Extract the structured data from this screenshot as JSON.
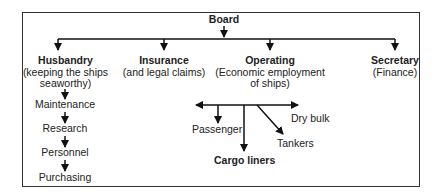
{
  "diagram": {
    "root": "Board",
    "departments": [
      {
        "title": "Husbandry",
        "subtitle_lines": [
          "(keeping the ships",
          "seaworthy)"
        ],
        "chain": [
          "Maintenance",
          "Research",
          "Personnel",
          "Purchasing"
        ]
      },
      {
        "title": "Insurance",
        "subtitle_lines": [
          "(and legal claims)"
        ]
      },
      {
        "title": "Operating",
        "subtitle_lines": [
          "(Economic employment",
          "of ships)"
        ],
        "branches": [
          "Passenger",
          "Cargo liners",
          "Tankers",
          "Dry bulk"
        ]
      },
      {
        "title": "Secretary",
        "subtitle_lines": [
          "(Finance)"
        ]
      }
    ]
  }
}
